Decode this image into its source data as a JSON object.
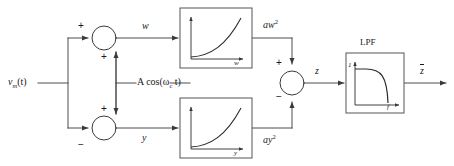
{
  "diagram": {
    "colors": {
      "line": "#4d4d4d",
      "stroke_dark": "#1a1a1a",
      "background": "#ffffff",
      "block_border": "#555555"
    },
    "input": {
      "label_main": "v",
      "label_sub": "m",
      "label_tail": "(t)",
      "name": "input-signal-vm-t"
    },
    "carrier": {
      "label_prefix": "A cos(",
      "label_omega": "ω",
      "label_sub": "c",
      "label_suffix": " t)"
    },
    "summer_top": {
      "sign_left": "+",
      "sign_bottom": "+",
      "output_label": "w"
    },
    "summer_bottom": {
      "sign_left": "−",
      "sign_top": "+",
      "output_label": "y"
    },
    "summer_output": {
      "sign_top": "+",
      "sign_bottom": "−",
      "output_label": "z"
    },
    "squarer_top": {
      "axis_label": "w",
      "output_label_base": "aw",
      "output_label_exp": "2"
    },
    "squarer_bottom": {
      "axis_label": "y",
      "output_label_base": "ay",
      "output_label_exp": "2"
    },
    "lpf": {
      "title": "LPF",
      "y_axis_label": "1",
      "x_axis_label": "f"
    },
    "output": {
      "label": "z"
    }
  }
}
